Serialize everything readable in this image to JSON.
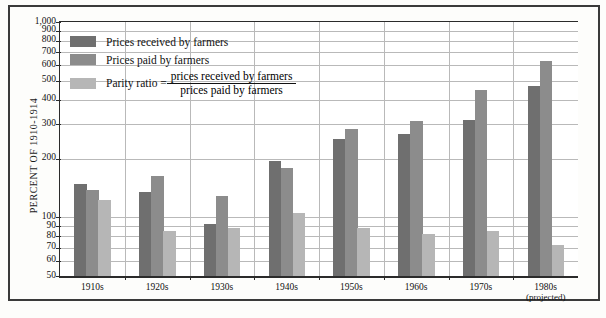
{
  "chart_data": {
    "type": "bar",
    "title": "",
    "subtitle": "",
    "xlabel": "",
    "ylabel": "PERCENT OF 1910-1914",
    "yscale": "log",
    "ylim": [
      50,
      1000
    ],
    "grid": true,
    "legend_position": "inside-top-left",
    "ytick_labels": [
      "1,000",
      "900",
      "800",
      "700",
      "600",
      "500",
      "400",
      "300",
      "200",
      "100",
      "90",
      "80",
      "70",
      "60",
      "50"
    ],
    "ytick_values": [
      1000,
      900,
      800,
      700,
      600,
      500,
      400,
      300,
      200,
      100,
      90,
      80,
      70,
      60,
      50
    ],
    "categories": [
      "1910s",
      "1920s",
      "1930s",
      "1940s",
      "1950s",
      "1960s",
      "1970s",
      "1980s"
    ],
    "category_sublabels": [
      "",
      "",
      "",
      "",
      "",
      "",
      "",
      "(projected)"
    ],
    "series": [
      {
        "name": "Prices received by farmers",
        "color": "#6f6f6f",
        "values": [
          148,
          135,
          92,
          195,
          253,
          268,
          315,
          470
        ]
      },
      {
        "name": "Prices paid by farmers",
        "color": "#8c8c8c",
        "values": [
          138,
          163,
          128,
          178,
          283,
          310,
          450,
          630
        ]
      },
      {
        "name": "Parity ratio",
        "color": "#b6b6b6",
        "values": [
          122,
          85,
          88,
          105,
          88,
          82,
          85,
          72
        ]
      }
    ],
    "annotations": []
  },
  "legend": {
    "items": [
      {
        "label": "Prices received by farmers",
        "color": "#6f6f6f"
      },
      {
        "label": "Prices paid by farmers",
        "color": "#8c8c8c"
      }
    ],
    "ratio": {
      "label": "Parity ratio =",
      "color": "#b6b6b6",
      "numerator": "prices received by farmers",
      "denominator": "prices paid by farmers"
    }
  },
  "axis": {
    "y_title": "PERCENT OF 1910-1914"
  }
}
